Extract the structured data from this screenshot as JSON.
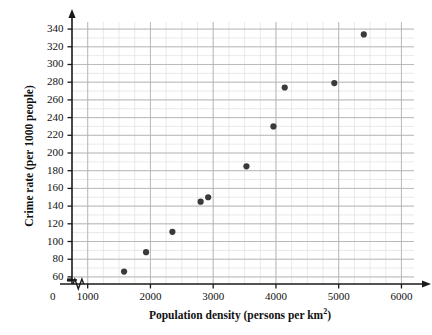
{
  "chart_data": {
    "type": "scatter",
    "title": "",
    "xlabel": "Population density (persons per km2)",
    "xlabel_base": "Population density (persons per km",
    "xlabel_sup": "2",
    "xlabel_tail": ")",
    "ylabel": "Crime rate (per 1000 people)",
    "xlim": [
      750,
      6200
    ],
    "ylim": [
      52,
      348
    ],
    "x_ticks": [
      1000,
      2000,
      3000,
      4000,
      5000,
      6000
    ],
    "x_tick_labels": [
      "1000",
      "2000",
      "3000",
      "4000",
      "5000",
      "6000"
    ],
    "y_ticks": [
      60,
      80,
      100,
      120,
      140,
      160,
      180,
      200,
      220,
      240,
      260,
      280,
      300,
      320,
      340
    ],
    "y_tick_labels": [
      "60",
      "80",
      "100",
      "120",
      "140",
      "160",
      "180",
      "200",
      "220",
      "240",
      "260",
      "280",
      "300",
      "320",
      "340"
    ],
    "origin_label": "0",
    "axis_break_x": true,
    "axis_break_y": true,
    "grid": true,
    "grid_minor_x_step": 250,
    "grid_minor_y_step": 10,
    "legend": "none",
    "marker_color": "#3a3a3a",
    "grid_major_color": "#b4b4b4",
    "grid_minor_color": "#e0e0e0",
    "axis_color": "#1a1a1a",
    "points": [
      {
        "x": 1580,
        "y": 66
      },
      {
        "x": 1930,
        "y": 88
      },
      {
        "x": 2350,
        "y": 111
      },
      {
        "x": 2800,
        "y": 145
      },
      {
        "x": 2920,
        "y": 150
      },
      {
        "x": 3530,
        "y": 185
      },
      {
        "x": 3960,
        "y": 230
      },
      {
        "x": 4140,
        "y": 274
      },
      {
        "x": 4930,
        "y": 279
      },
      {
        "x": 5400,
        "y": 334
      }
    ]
  }
}
